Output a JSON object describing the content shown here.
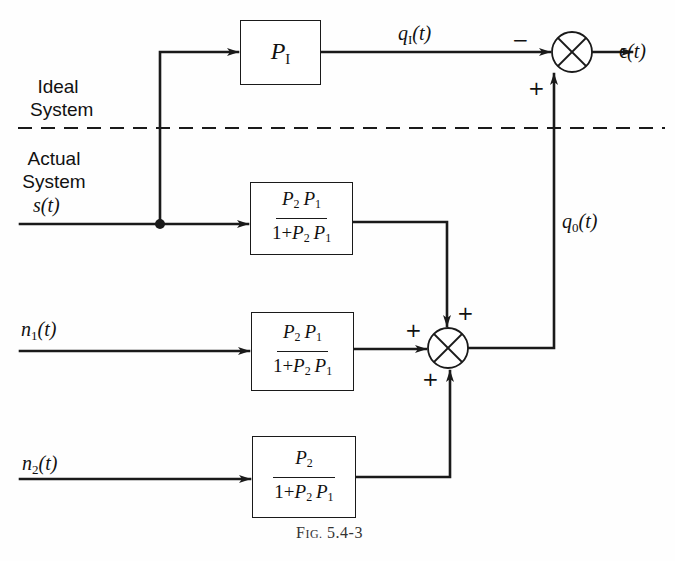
{
  "figure": {
    "caption_prefix": "F",
    "caption_smallcaps": "IG.",
    "caption_number": "5.4-3"
  },
  "regions": {
    "ideal_line1": "Ideal",
    "ideal_line2": "System",
    "actual_line1": "Actual",
    "actual_line2": "System"
  },
  "signals": {
    "input_s": {
      "name": "s",
      "arg": "(t)"
    },
    "noise_n1": {
      "name": "n",
      "sub": "1",
      "arg": "(t)"
    },
    "noise_n2": {
      "name": "n",
      "sub": "2",
      "arg": "(t)"
    },
    "ideal_output": {
      "name": "q",
      "sub": "I",
      "arg": "(t)"
    },
    "actual_output": {
      "name": "q",
      "sub": "0",
      "arg": "(t)"
    },
    "error": {
      "name": "ϵ",
      "arg": "(t)"
    }
  },
  "blocks": {
    "ideal": {
      "name": "P",
      "sub": "I"
    },
    "signal_tf": {
      "num": [
        "P",
        "2",
        "P",
        "1"
      ],
      "den_prefix": "1+",
      "den": [
        "P",
        "2",
        "P",
        "1"
      ]
    },
    "noise1_tf": {
      "num": [
        "P",
        "2",
        "P",
        "1"
      ],
      "den_prefix": "1+",
      "den": [
        "P",
        "2",
        "P",
        "1"
      ]
    },
    "noise2_tf": {
      "num": [
        "P",
        "2"
      ],
      "den_prefix": "1+",
      "den": [
        "P",
        "2",
        "P",
        "1"
      ]
    }
  },
  "summing_junctions": {
    "error_junction": {
      "top_input_sign": "−",
      "bottom_input_sign": "+"
    },
    "output_junction": {
      "left_sign": "+",
      "top_sign": "+",
      "bottom_sign": "+"
    }
  },
  "colors": {
    "ink": "#1a1a1a",
    "background": "#fefefe"
  }
}
